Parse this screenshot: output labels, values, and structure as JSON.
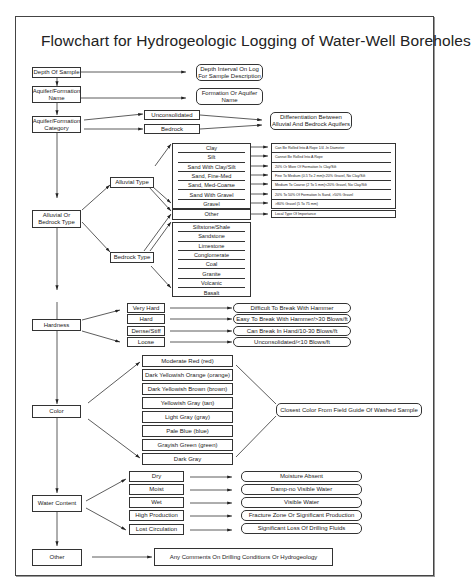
{
  "title": "Flowchart for Hydrogeologic Logging of Water-Well Boreholes",
  "main_steps": [
    {
      "label": "Depth Of Sample"
    },
    {
      "label": "Aquifer/Formation Name"
    },
    {
      "label": "Aquifer/Formation Category"
    },
    {
      "label": "Alluvial Or Bedrock Type"
    },
    {
      "label": "Hardness"
    },
    {
      "label": "Color"
    },
    {
      "label": "Water Content"
    },
    {
      "label": "Other"
    }
  ],
  "depth": {
    "result": "Depth Interval On Log For Sample Description"
  },
  "name": {
    "result": "Formation Or Aquifer Name"
  },
  "category": {
    "options": [
      "Unconsolidated",
      "Bedrock"
    ],
    "result": "Differentiation Between Alluvial And Bedrock Aquifers"
  },
  "type": {
    "alluvial_label": "Alluvial Type",
    "bedrock_label": "Bedrock Type",
    "alluvial_items": [
      {
        "label": "Clay",
        "desc": "Can Be Rolled Into A Rope 1/4 -In Diameter"
      },
      {
        "label": "Silt",
        "desc": "Cannot Be Rolled Into A Rope"
      },
      {
        "label": "Sand With Clay/Silt",
        "desc": "20% Or More Of Formation Is Clay/Silt"
      },
      {
        "label": "Sand, Fine-Med",
        "desc": "Fine To Medium (0.5 To 2 mm)<20% Gravel, No Clay/Silt"
      },
      {
        "label": "Sand, Med-Coarse",
        "desc": "Medium To Coarse (2 To 5 mm)<20% Gravel, No Clay/Silt"
      },
      {
        "label": "Sand With Gravel",
        "desc": "20% To 50% Of Formation Is Sand, >50% Gravel"
      },
      {
        "label": "Gravel",
        "desc": ">80% Gravel (5 To 75 mm)"
      }
    ],
    "other": {
      "label": "Other",
      "desc": "Local Type Of Importance"
    },
    "bedrock_items": [
      "Siltstone/Shale",
      "Sandstone",
      "Limestone",
      "Conglomerate",
      "Coal",
      "Granite",
      "Volcanic",
      "Basalt"
    ]
  },
  "hardness": {
    "items": [
      {
        "label": "Very Hard",
        "result": "Difficult To Break With Hammer"
      },
      {
        "label": "Hard",
        "result": "Easy To Break With Hammer/>30 Blows/ft"
      },
      {
        "label": "Dense/Stiff",
        "result": "Can Break In Hand/10-30 Blows/ft"
      },
      {
        "label": "Loose",
        "result": "Unconsolidated/<10 Blows/ft"
      }
    ]
  },
  "color": {
    "items": [
      "Moderate Red (red)",
      "Dark Yellowish Orange (orange)",
      "Dark Yellowish Brown (brown)",
      "Yellowish Gray (tan)",
      "Light Gray (gray)",
      "Pale Blue (blue)",
      "Grayish Green (green)",
      "Dark Gray"
    ],
    "result": "Closest Color From Field Guide Of Washed Sample"
  },
  "water": {
    "items": [
      {
        "label": "Dry",
        "result": "Moisture Absent"
      },
      {
        "label": "Moist",
        "result": "Damp-no Visible Water"
      },
      {
        "label": "Wet",
        "result": "Visible Water"
      },
      {
        "label": "High Production",
        "result": "Fracture Zone Or Significant Production"
      },
      {
        "label": "Lost Circulation",
        "result": "Significant Loss Of Drilling Fluids"
      }
    ]
  },
  "other": {
    "result": "Any Comments On Drilling Conditions Or Hydrogeology"
  }
}
